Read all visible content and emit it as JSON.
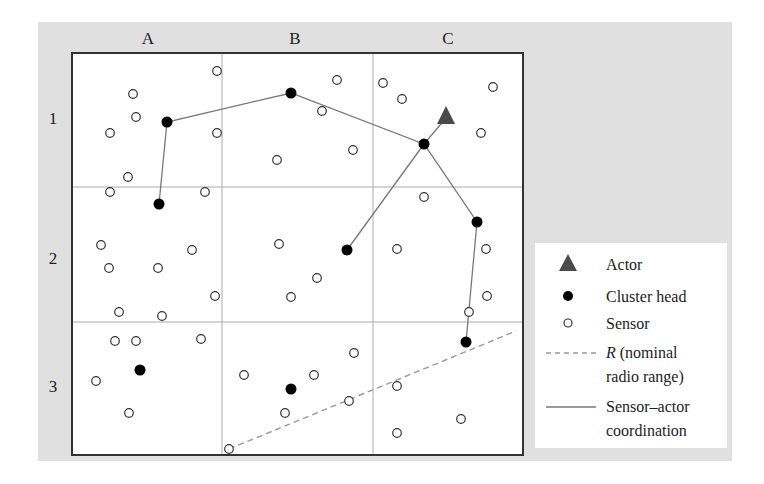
{
  "columns": [
    "A",
    "B",
    "C"
  ],
  "rows": [
    "1",
    "2",
    "3"
  ],
  "colors": {
    "background": "#e0e0e0",
    "grid_line": "#aaaaaa",
    "border": "#333333",
    "actor": "#4a4a4a",
    "cluster_head": "#000000",
    "link": "#777777",
    "range": "#999999"
  },
  "actor": {
    "x": 446,
    "y": 116
  },
  "cluster_heads": [
    {
      "x": 167,
      "y": 122
    },
    {
      "x": 291,
      "y": 93
    },
    {
      "x": 424,
      "y": 144
    },
    {
      "x": 159,
      "y": 204
    },
    {
      "x": 347,
      "y": 250
    },
    {
      "x": 477,
      "y": 222
    },
    {
      "x": 466,
      "y": 342
    },
    {
      "x": 140,
      "y": 370
    },
    {
      "x": 291,
      "y": 389
    }
  ],
  "sensors": [
    {
      "x": 217,
      "y": 71
    },
    {
      "x": 133,
      "y": 94
    },
    {
      "x": 136,
      "y": 117
    },
    {
      "x": 110,
      "y": 133
    },
    {
      "x": 217,
      "y": 133
    },
    {
      "x": 128,
      "y": 177
    },
    {
      "x": 337,
      "y": 80
    },
    {
      "x": 322,
      "y": 111
    },
    {
      "x": 353,
      "y": 150
    },
    {
      "x": 277,
      "y": 160
    },
    {
      "x": 383,
      "y": 83
    },
    {
      "x": 402,
      "y": 99
    },
    {
      "x": 493,
      "y": 87
    },
    {
      "x": 481,
      "y": 133
    },
    {
      "x": 110,
      "y": 192
    },
    {
      "x": 205,
      "y": 192
    },
    {
      "x": 101,
      "y": 245
    },
    {
      "x": 192,
      "y": 250
    },
    {
      "x": 109,
      "y": 268
    },
    {
      "x": 158,
      "y": 268
    },
    {
      "x": 215,
      "y": 296
    },
    {
      "x": 119,
      "y": 312
    },
    {
      "x": 162,
      "y": 316
    },
    {
      "x": 279,
      "y": 244
    },
    {
      "x": 317,
      "y": 278
    },
    {
      "x": 291,
      "y": 297
    },
    {
      "x": 424,
      "y": 197
    },
    {
      "x": 397,
      "y": 249
    },
    {
      "x": 486,
      "y": 249
    },
    {
      "x": 487,
      "y": 296
    },
    {
      "x": 469,
      "y": 312
    },
    {
      "x": 115,
      "y": 341
    },
    {
      "x": 136,
      "y": 341
    },
    {
      "x": 201,
      "y": 339
    },
    {
      "x": 96,
      "y": 381
    },
    {
      "x": 129,
      "y": 413
    },
    {
      "x": 244,
      "y": 375
    },
    {
      "x": 314,
      "y": 375
    },
    {
      "x": 354,
      "y": 353
    },
    {
      "x": 285,
      "y": 413
    },
    {
      "x": 349,
      "y": 401
    },
    {
      "x": 397,
      "y": 386
    },
    {
      "x": 461,
      "y": 419
    },
    {
      "x": 397,
      "y": 433
    },
    {
      "x": 229,
      "y": 449
    }
  ],
  "coordination_paths": [
    [
      [
        159,
        204
      ],
      [
        167,
        122
      ],
      [
        291,
        93
      ],
      [
        424,
        144
      ],
      [
        446,
        118
      ]
    ],
    [
      [
        347,
        250
      ],
      [
        424,
        144
      ],
      [
        477,
        222
      ],
      [
        466,
        342
      ]
    ]
  ],
  "radio_range_line": {
    "x1": 229,
    "y1": 449,
    "x2": 516,
    "y2": 331
  },
  "legend": {
    "items": [
      {
        "symbol": "triangle",
        "label": "Actor"
      },
      {
        "symbol": "filled-circle",
        "label": "Cluster head"
      },
      {
        "symbol": "open-circle",
        "label": "Sensor"
      },
      {
        "symbol": "dashed-line",
        "label_italic": "R",
        "label": " (nominal",
        "label2": "radio range)"
      },
      {
        "symbol": "solid-line",
        "label": "Sensor–actor",
        "label2": "coordination"
      }
    ]
  }
}
